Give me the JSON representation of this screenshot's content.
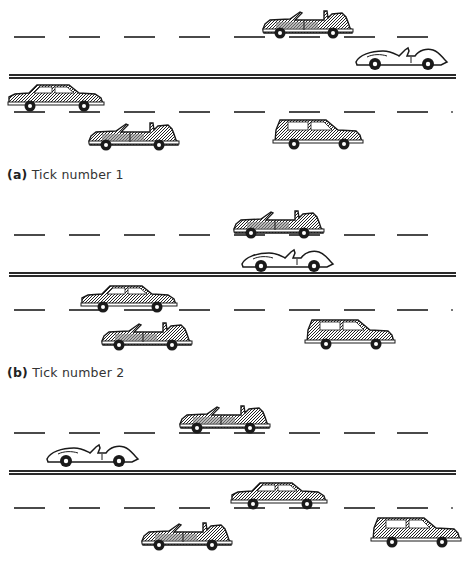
{
  "figure": {
    "panels": [
      {
        "label": "(a)",
        "caption": "Tick number 1",
        "top": 0,
        "cars": [
          {
            "type": "convertible",
            "lane": "upper-1",
            "x": 262,
            "y": 8
          },
          {
            "type": "roadster",
            "lane": "upper-2",
            "x": 353,
            "y": 42
          },
          {
            "type": "sedan",
            "lane": "lower-1",
            "x": 7,
            "y": 82
          },
          {
            "type": "convertible",
            "lane": "lower-2",
            "x": 88,
            "y": 120
          },
          {
            "type": "suv",
            "lane": "lower-2",
            "x": 272,
            "y": 118
          }
        ]
      },
      {
        "label": "(b)",
        "caption": "Tick number 2",
        "top": 198,
        "cars": [
          {
            "type": "convertible",
            "lane": "upper-1",
            "x": 233,
            "y": 10
          },
          {
            "type": "roadster",
            "lane": "upper-2",
            "x": 239,
            "y": 46
          },
          {
            "type": "sedan",
            "lane": "lower-1",
            "x": 80,
            "y": 85
          },
          {
            "type": "convertible",
            "lane": "lower-2",
            "x": 101,
            "y": 122
          },
          {
            "type": "suv",
            "lane": "lower-2",
            "x": 304,
            "y": 120
          }
        ]
      },
      {
        "label": "(c)",
        "caption": "",
        "top": 396,
        "cars": [
          {
            "type": "convertible",
            "lane": "upper-1",
            "x": 179,
            "y": 7
          },
          {
            "type": "roadster",
            "lane": "upper-2",
            "x": 44,
            "y": 43
          },
          {
            "type": "sedan",
            "lane": "lower-1",
            "x": 230,
            "y": 84
          },
          {
            "type": "convertible",
            "lane": "lower-2",
            "x": 141,
            "y": 124
          },
          {
            "type": "suv",
            "lane": "lower-2",
            "x": 370,
            "y": 120
          }
        ]
      }
    ],
    "road": {
      "upper_dash_y": 36,
      "divider_y": 74,
      "lower_dash_y": 111,
      "dash_start_x": [
        14,
        69,
        124,
        179,
        234,
        289,
        344,
        397
      ]
    },
    "colors": {
      "ink": "#1a1a1a",
      "shade": "#8a8a8a",
      "line": "#4a4a4a",
      "background": "#ffffff"
    }
  }
}
